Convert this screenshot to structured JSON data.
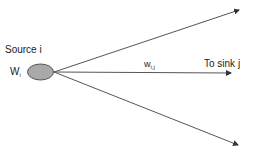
{
  "diagram": {
    "source_label": "Source i",
    "weight_node": {
      "base": "W",
      "sub": "i"
    },
    "edge_weight": {
      "base": "w",
      "sub": "i,j"
    },
    "sink_label": "To sink j",
    "colors": {
      "node_fill": "#a9a9a9",
      "node_stroke": "#555555",
      "edge": "#555555"
    },
    "edges": [
      {
        "name": "edge-up",
        "to": [
          239,
          10
        ]
      },
      {
        "name": "edge-middle",
        "to": [
          231,
          73
        ]
      },
      {
        "name": "edge-down",
        "to": [
          238,
          145
        ]
      }
    ]
  }
}
